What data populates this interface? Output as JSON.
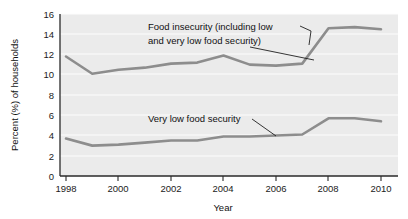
{
  "chart_data": {
    "type": "line",
    "title": "",
    "xlabel": "Year",
    "ylabel": "Percent (%) of households",
    "xlim": [
      1998,
      2010
    ],
    "ylim": [
      0,
      16
    ],
    "grid": true,
    "legend": "annotations-inline",
    "x": [
      1998,
      1999,
      2000,
      2001,
      2002,
      2003,
      2004,
      2005,
      2006,
      2007,
      2008,
      2009,
      2010
    ],
    "xticks": [
      "1998",
      "2000",
      "2002",
      "2004",
      "2006",
      "2008",
      "2010"
    ],
    "yticks": [
      "0",
      "2",
      "4",
      "6",
      "8",
      "10",
      "12",
      "14",
      "16"
    ],
    "series": [
      {
        "name": "Food insecurity (including low and very low food security)",
        "color": "#8d8d8d",
        "values": [
          11.8,
          10.1,
          10.5,
          10.7,
          11.1,
          11.2,
          11.9,
          11.0,
          10.9,
          11.1,
          14.6,
          14.7,
          14.5
        ]
      },
      {
        "name": "Very low food security",
        "color": "#8d8d8d",
        "values": [
          3.7,
          3.0,
          3.1,
          3.3,
          3.5,
          3.5,
          3.9,
          3.9,
          4.0,
          4.1,
          5.7,
          5.7,
          5.4
        ]
      }
    ],
    "annotations": [
      {
        "id": "food-insecurity-annotation",
        "line1": "Food insecurity (including low",
        "line2": "and very low food security)"
      },
      {
        "id": "very-low-food-security-annotation",
        "line1": "Very low food security"
      }
    ]
  }
}
